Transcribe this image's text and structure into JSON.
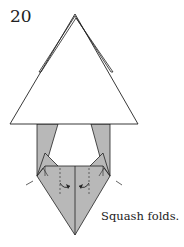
{
  "step_number": "20",
  "caption": "Squash folds.",
  "colors": {
    "paper_front": "#ffffff",
    "paper_back": "#b8b8b8",
    "line": "#222222"
  },
  "diagram": {
    "arrows": [
      "squash-fold-arrow-left",
      "squash-fold-arrow-right"
    ]
  }
}
